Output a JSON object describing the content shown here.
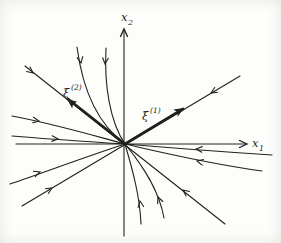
{
  "figure": {
    "ink": "#222120",
    "background": "#fdfdfb",
    "labels": {
      "y_main": "x",
      "y_sub": "2",
      "x_main": "x",
      "x_sub": "1",
      "eig1_main": "ξ",
      "eig1_sup": "(1)",
      "eig2_main": "ξ",
      "eig2_sup": "(2)"
    },
    "origin": [
      125,
      144
    ],
    "paths": [
      {
        "name": "x2-axis",
        "d": "M124,236 L124,30",
        "w": 1.1
      },
      {
        "name": "x1-axis",
        "d": "M16,144 L246,144",
        "w": 1.1
      },
      {
        "name": "eig1-trajectory-line",
        "d": "M22,206 L240,76",
        "w": 1.1
      },
      {
        "name": "eig1-vector-heavy",
        "d": "M125,144 L183,109",
        "w": 2.8
      },
      {
        "name": "eig2-trajectory-line",
        "d": "M25,66 L225,224",
        "w": 1.1
      },
      {
        "name": "eig2-vector-heavy",
        "d": "M125,144 L68,99",
        "w": 2.8
      },
      {
        "name": "trajectory-top-1",
        "d": "M77,47 C82,85 95,122 125,144",
        "w": 1.1
      },
      {
        "name": "trajectory-top-2",
        "d": "M106,48 C104,85 110,122 125,144",
        "w": 1.1
      },
      {
        "name": "trajectory-bottom-1",
        "d": "M125,144 C132,168 140,196 141,224",
        "w": 1.1
      },
      {
        "name": "trajectory-bottom-2",
        "d": "M125,144 C143,166 159,190 164,218",
        "w": 1.1
      },
      {
        "name": "trajectory-left-1",
        "d": "M12,116 C55,124 95,136 125,144",
        "w": 1.1
      },
      {
        "name": "trajectory-left-2",
        "d": "M12,136 C60,140 95,142 125,144",
        "w": 1.1
      },
      {
        "name": "trajectory-left-3",
        "d": "M10,184 C45,172 88,156 125,144",
        "w": 1.1
      },
      {
        "name": "trajectory-right-1",
        "d": "M272,155 C210,151 160,147 125,144",
        "w": 1.1
      },
      {
        "name": "trajectory-right-2",
        "d": "M262,171 C205,163 160,152 125,144",
        "w": 1.1
      }
    ],
    "arrows": [
      {
        "name": "x2-axis-arrowhead",
        "x": 124,
        "y": 29,
        "a": -90,
        "t": "open",
        "s": 1.25
      },
      {
        "name": "x1-axis-arrowhead",
        "x": 247,
        "y": 144,
        "a": 0,
        "t": "open",
        "s": 1.25
      },
      {
        "name": "eig1-vector-arrowhead",
        "x": 184,
        "y": 108,
        "a": -31,
        "t": "solid",
        "s": 1.1
      },
      {
        "name": "eig2-vector-arrowhead",
        "x": 67,
        "y": 99,
        "a": 218,
        "t": "solid",
        "s": 1.1
      },
      {
        "name": "flow-arrow-eig1-upper",
        "x": 211,
        "y": 93,
        "a": 149,
        "t": "open",
        "s": 1
      },
      {
        "name": "flow-arrow-eig1-lower",
        "x": 52,
        "y": 188,
        "a": -31,
        "t": "open",
        "s": 1
      },
      {
        "name": "flow-arrow-eig2-upper",
        "x": 33,
        "y": 73,
        "a": 38,
        "t": "open",
        "s": 1
      },
      {
        "name": "flow-arrow-eig2-lower",
        "x": 183,
        "y": 190,
        "a": 218,
        "t": "open",
        "s": 1
      },
      {
        "name": "flow-arrow-top-1",
        "x": 81,
        "y": 63,
        "a": 80,
        "t": "open",
        "s": 1
      },
      {
        "name": "flow-arrow-top-2",
        "x": 105,
        "y": 64,
        "a": 95,
        "t": "open",
        "s": 1
      },
      {
        "name": "flow-arrow-bottom-1",
        "x": 140,
        "y": 201,
        "a": -98,
        "t": "open",
        "s": 1
      },
      {
        "name": "flow-arrow-bottom-2",
        "x": 158,
        "y": 197,
        "a": -112,
        "t": "open",
        "s": 1
      },
      {
        "name": "flow-arrow-left-1",
        "x": 39,
        "y": 121,
        "a": 10,
        "t": "open",
        "s": 1
      },
      {
        "name": "flow-arrow-left-2",
        "x": 58,
        "y": 139,
        "a": 4,
        "t": "open",
        "s": 1
      },
      {
        "name": "flow-arrow-left-3",
        "x": 40,
        "y": 172,
        "a": -19,
        "t": "open",
        "s": 1
      },
      {
        "name": "flow-arrow-right-1",
        "x": 196,
        "y": 149,
        "a": 184,
        "t": "open",
        "s": 1
      },
      {
        "name": "flow-arrow-right-2",
        "x": 197,
        "y": 161,
        "a": 193,
        "t": "open",
        "s": 1
      }
    ]
  }
}
